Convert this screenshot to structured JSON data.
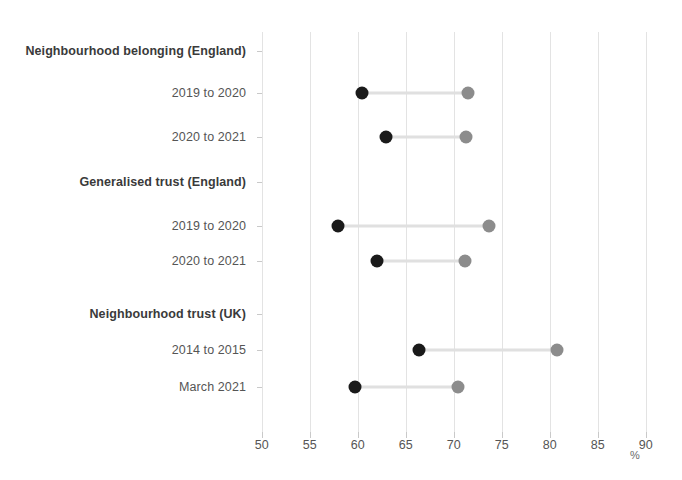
{
  "chart_data": {
    "type": "scatter",
    "title": "",
    "subtitle": "",
    "xlabel": "%",
    "ylabel": "",
    "xlim": [
      50,
      90
    ],
    "xticks": [
      50,
      55,
      60,
      65,
      70,
      75,
      80,
      85,
      90
    ],
    "grid": "vertical",
    "legend": "none",
    "orientation": "horizontal",
    "style": "dumbbell",
    "colors": {
      "dark_point": "#1a1a1a",
      "light_point": "#8c8c8c",
      "connector": "#e0e0e0",
      "gridline": "#e3e3e3",
      "axis": "#d0d0d0",
      "text": "#555555",
      "group_text": "#3a3a3a",
      "background": "#ffffff"
    },
    "groups": [
      {
        "label": "Neighbourhood belonging (England)",
        "rows": [
          {
            "label": "2019 to 2020",
            "dark": 60.5,
            "light": 71.5
          },
          {
            "label": "2020 to 2021",
            "dark": 62.9,
            "light": 71.3
          }
        ]
      },
      {
        "label": "Generalised trust (England)",
        "rows": [
          {
            "label": "2019 to 2020",
            "dark": 58.0,
            "light": 73.7
          },
          {
            "label": "2020 to 2021",
            "dark": 62.0,
            "light": 71.2
          }
        ]
      },
      {
        "label": "Neighbourhood trust (UK)",
        "rows": [
          {
            "label": "2014 to 2015",
            "dark": 66.4,
            "light": 80.8
          },
          {
            "label": "March 2021",
            "dark": 59.7,
            "light": 70.4
          }
        ]
      }
    ]
  }
}
